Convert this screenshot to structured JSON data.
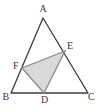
{
  "figure": {
    "kind": "euclidean-geometry-diagram",
    "width": 103,
    "height": 110,
    "background_color": "#ffffff",
    "stroke_color": "#3c3c3c",
    "shaded_fill_color": "#d9d9d9",
    "shaded_stroke_color": "#8a8a8a",
    "stroke_width": 1.3,
    "points": [
      {
        "name": "A",
        "label": "A",
        "x": 43.0,
        "y": 18.0,
        "label_x": 39.5,
        "label_y": 4.0,
        "on": "apex of triangle ABC"
      },
      {
        "name": "B",
        "label": "B",
        "x": 11.0,
        "y": 93.0,
        "label_x": 2.5,
        "label_y": 92.0,
        "on": "bottom-left vertex of triangle ABC"
      },
      {
        "name": "C",
        "label": "C",
        "x": 88.0,
        "y": 93.0,
        "label_x": 88.0,
        "label_y": 92.0,
        "on": "bottom-right vertex of triangle ABC"
      },
      {
        "name": "D",
        "label": "D",
        "x": 44.0,
        "y": 93.0,
        "label_x": 41.0,
        "label_y": 95.0,
        "on": "segment BC"
      },
      {
        "name": "E",
        "label": "E",
        "x": 65.0,
        "y": 51.0,
        "label_x": 67.0,
        "label_y": 41.0,
        "on": "segment AC"
      },
      {
        "name": "F",
        "label": "F",
        "x": 22.0,
        "y": 68.0,
        "label_x": 13.0,
        "label_y": 61.0,
        "on": "segment AB"
      }
    ],
    "outer_triangle": {
      "name": "ABC",
      "vertices": [
        "A",
        "B",
        "C"
      ],
      "filled": false
    },
    "shaded_triangle": {
      "name": "DEF",
      "vertices": [
        "D",
        "E",
        "F"
      ],
      "filled": true
    },
    "segments": [
      {
        "name": "AB",
        "from": "A",
        "to": "B"
      },
      {
        "name": "BC",
        "from": "B",
        "to": "C"
      },
      {
        "name": "CA",
        "from": "C",
        "to": "A"
      },
      {
        "name": "FE",
        "from": "F",
        "to": "E"
      },
      {
        "name": "ED",
        "from": "E",
        "to": "D"
      },
      {
        "name": "DF",
        "from": "D",
        "to": "F"
      }
    ]
  }
}
